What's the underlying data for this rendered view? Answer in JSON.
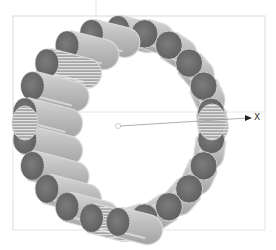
{
  "viewport": {
    "background": "#ffffff",
    "frame_color": "#e4e4e4",
    "bounding_box": {
      "x": 13,
      "y": 16,
      "width": 252,
      "height": 96
    },
    "lower_box": {
      "x": 13,
      "y": 16,
      "width": 252,
      "height": 214
    }
  },
  "model": {
    "type": "ring-of-cylinders",
    "center": {
      "x": 118,
      "y": 126
    },
    "radius": 96,
    "segment_count": 22,
    "cylinder_radius": 15,
    "cylinder_length": 34,
    "end_cap_color": "#6e6e6e",
    "body_color": "#b8b8b8",
    "highlight_color": "#e8e8e8",
    "outline_color": "#d9d9d9"
  },
  "axis": {
    "origin": {
      "x": 118,
      "y": 126
    },
    "end": {
      "x": 250,
      "y": 118
    },
    "label": "X",
    "color": "#888888"
  }
}
